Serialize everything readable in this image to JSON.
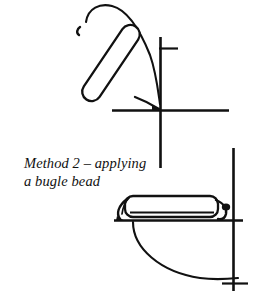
{
  "figure": {
    "title": "Method 2 – applying a bugle bead",
    "caption_line_1": "Method 2 – applying",
    "caption_line_2": "a bugle bead",
    "caption_text": "Method 2 – applying\na bugle bead",
    "method_number": "2",
    "technique": "applying a bugle bead",
    "style": "line-drawing",
    "colors": {
      "background": "#ffffff",
      "ink": "#111111",
      "bead_fill": "#ffffff"
    },
    "panels": [
      {
        "id": "upper-panel",
        "name": "bugle-bead-angled-placement",
        "description": "Bugle bead held at an angle above a fabric fold with thread looping over the bead top and down to the needle point"
      },
      {
        "id": "lower-panel",
        "name": "bugle-bead-couched-flat",
        "description": "Bugle bead lying flat along the fabric edge with thread loops at each end and a curved fabric fold beneath"
      }
    ],
    "elements": [
      {
        "name": "bugle-bead-upper",
        "label": "bugle bead"
      },
      {
        "name": "thread-loop-upper",
        "label": "thread"
      },
      {
        "name": "fabric-edge-vertical-upper",
        "label": "fabric edge"
      },
      {
        "name": "fabric-edge-horizontal-upper",
        "label": "fabric edge"
      },
      {
        "name": "bugle-bead-lower",
        "label": "bugle bead"
      },
      {
        "name": "thread-loop-lower-left",
        "label": "thread"
      },
      {
        "name": "thread-loop-lower-right",
        "label": "thread"
      },
      {
        "name": "fabric-fold-curve-lower",
        "label": "fabric fold"
      },
      {
        "name": "fabric-edge-vertical-lower",
        "label": "fabric edge"
      },
      {
        "name": "fabric-edge-horizontal-lower",
        "label": "fabric edge"
      }
    ]
  }
}
